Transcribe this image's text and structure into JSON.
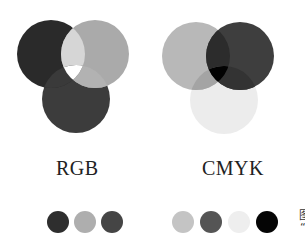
{
  "rgb": {
    "label": "RGB",
    "circles": [
      {
        "name": "red",
        "cx": 51,
        "cy": 54,
        "r": 34,
        "color": "#2a2a2a"
      },
      {
        "name": "green",
        "cx": 95,
        "cy": 54,
        "r": 34,
        "color": "#aaaaaa"
      },
      {
        "name": "blue",
        "cx": 76,
        "cy": 99,
        "r": 34,
        "color": "#3c3c3c"
      }
    ],
    "swatches": [
      "#2e2e2e",
      "#aeaeae",
      "#454545"
    ]
  },
  "cmyk": {
    "label": "CMYK",
    "circles": [
      {
        "name": "cyan",
        "cx": 196,
        "cy": 56,
        "r": 34,
        "color": "#b8b8b8"
      },
      {
        "name": "magenta",
        "cx": 240,
        "cy": 56,
        "r": 34,
        "color": "#3e3e3e"
      },
      {
        "name": "yellow",
        "cx": 224,
        "cy": 100,
        "r": 34,
        "color": "#ececec"
      }
    ],
    "swatches": [
      "#c4c4c4",
      "#555555",
      "#eeeeee",
      "#050505"
    ]
  },
  "edge_text": {
    "top": "图",
    "bottom": "“"
  }
}
